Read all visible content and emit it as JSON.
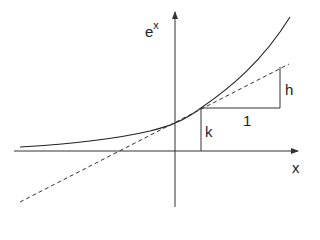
{
  "diagram": {
    "labels": {
      "y_axis_base": "e",
      "y_axis_exp": "x",
      "x_axis": "x",
      "rise": "h",
      "run": "1",
      "height": "k"
    },
    "elements": {
      "curve": "y = e^x (solid)",
      "tangent": "tangent line (dashed)",
      "triangle": "slope triangle with run 1 and rise h",
      "vertical_segment": "height k from x-axis to curve at tangent point"
    },
    "colors": {
      "line": "#222222",
      "background": "#ffffff"
    }
  }
}
